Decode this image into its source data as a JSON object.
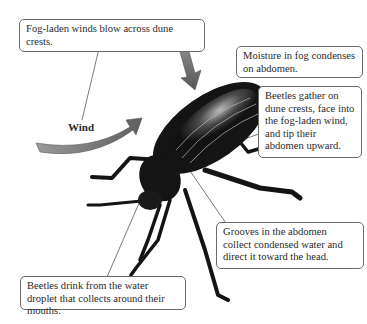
{
  "diagram": {
    "wind_label": "Wind",
    "callouts": [
      {
        "id": "fog-winds",
        "text": "Fog-laden winds blow across dune crests."
      },
      {
        "id": "moisture",
        "text": "Moisture in fog condenses on abdomen."
      },
      {
        "id": "beetles-gather",
        "text": "Beetles gather on dune crests, face into the fog-laden wind, and tip their abdomen upward."
      },
      {
        "id": "grooves",
        "text": "Grooves in the abdomen collect condensed water and direct it toward the head."
      },
      {
        "id": "drink",
        "text": "Beetles drink from the water droplet that collects around their mouths."
      }
    ],
    "colors": {
      "arrow": "#6e6e6e",
      "beetle": "#141414",
      "callout_border": "#6a6a6a",
      "leader_line": "#555555"
    }
  }
}
